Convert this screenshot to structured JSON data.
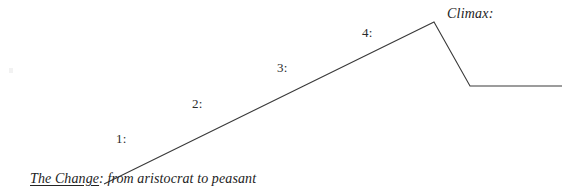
{
  "diagram": {
    "title_caption": {
      "underlined_text": "The Change",
      "rest_text": ": from aristocrat to peasant"
    },
    "climax_label": "Climax:",
    "stages": [
      {
        "label": "1:"
      },
      {
        "label": "2:"
      },
      {
        "label": "3:"
      },
      {
        "label": "4:"
      }
    ],
    "colors": {
      "background": "#ffffff",
      "line": "#3a3a3a",
      "text": "#232323"
    },
    "plot_shape": {
      "type": "line",
      "description": "rising-action to climax then falling action to resolution",
      "points": [
        {
          "x": 104,
          "y": 184,
          "name": "exposition-start"
        },
        {
          "x": 434,
          "y": 22,
          "name": "climax-peak"
        },
        {
          "x": 470,
          "y": 86,
          "name": "falling-action-end"
        },
        {
          "x": 562,
          "y": 86,
          "name": "resolution-end"
        }
      ]
    }
  }
}
